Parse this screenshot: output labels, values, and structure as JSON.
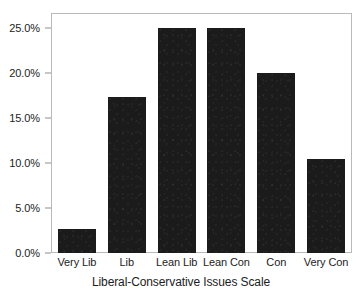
{
  "chart_data": {
    "type": "bar",
    "title": "",
    "xlabel": "Liberal-Conservative Issues Scale",
    "ylabel": "",
    "categories": [
      "Very Lib",
      "Lib",
      "Lean Lib",
      "Lean Con",
      "Con",
      "Very Con"
    ],
    "values": [
      2.7,
      17.3,
      25.0,
      25.0,
      20.0,
      10.4
    ],
    "value_labels": [
      "2.7%",
      "17.3%",
      "25.0%",
      "25.0%",
      "20.0%",
      "10.4%"
    ],
    "ylim": [
      0,
      26.5
    ],
    "y_ticks": [
      0,
      5,
      10,
      15,
      20,
      25
    ],
    "y_tick_labels": [
      "0.0%",
      "5.0%",
      "10.0%",
      "15.0%",
      "20.0%",
      "25.0%"
    ],
    "grid": false,
    "legend": null,
    "bar_color": "#1b1b1b",
    "axis_color": "#b9b9b9",
    "background_color": "#ffffff"
  }
}
